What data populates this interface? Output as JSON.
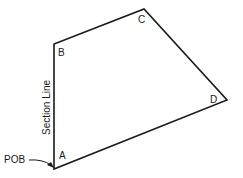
{
  "diagram": {
    "vertices": [
      {
        "label": "A",
        "x": 54,
        "y": 169
      },
      {
        "label": "B",
        "x": 54,
        "y": 44
      },
      {
        "label": "C",
        "x": 144,
        "y": 9
      },
      {
        "label": "D",
        "x": 227,
        "y": 100
      }
    ],
    "labels": {
      "A": "A",
      "B": "B",
      "C": "C",
      "D": "D",
      "section_line": "Section Line",
      "pob": "POB"
    },
    "colors": {
      "line": "#1a1a1a",
      "background": "#ffffff"
    }
  }
}
